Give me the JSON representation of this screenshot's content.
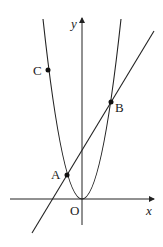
{
  "diagram": {
    "axes": {
      "x_label": "x",
      "y_label": "y",
      "origin_label": "O"
    },
    "points": [
      {
        "name": "A",
        "label": "A"
      },
      {
        "name": "B",
        "label": "B"
      },
      {
        "name": "C",
        "label": "C"
      }
    ],
    "curves": [
      "parabola y = ax^2 (vertex at O)",
      "line through A and B"
    ],
    "colors": {
      "stroke": "#222222",
      "background": "#ffffff"
    }
  }
}
